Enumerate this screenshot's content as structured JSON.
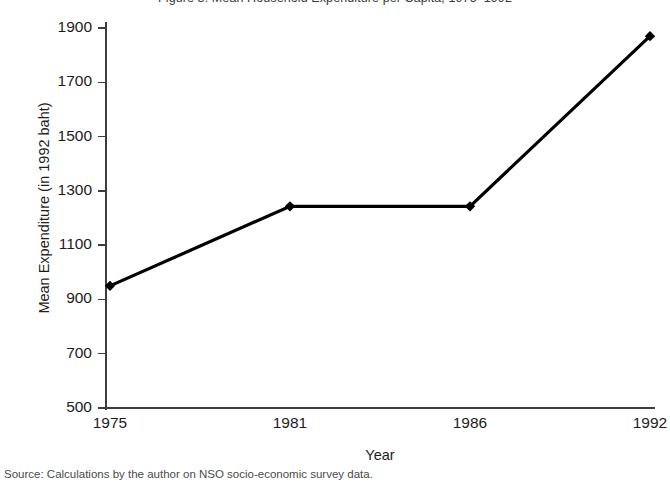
{
  "figure": {
    "clipped_title_top": "Figure 3.  Mean Household Expenditure per Capita, 1975–1992",
    "clipped_caption_bottom": "Source:  Calculations by the author on NSO socio-economic survey data."
  },
  "chart_data": {
    "type": "line",
    "title": "",
    "xlabel": "Year",
    "ylabel": "Mean Expenditure (in 1992 baht)",
    "categories": [
      "1975",
      "1981",
      "1986",
      "1992"
    ],
    "x": [
      1975,
      1981,
      1986,
      1992
    ],
    "values": [
      950,
      1243,
      1243,
      1870
    ],
    "series": [
      {
        "name": "Mean Expenditure",
        "values": [
          950,
          1243,
          1243,
          1870
        ]
      }
    ],
    "ylim": [
      500,
      1900
    ],
    "yticks": [
      500,
      700,
      900,
      1100,
      1300,
      1500,
      1700,
      1900
    ],
    "ytick_labels": [
      "500",
      "700",
      "900",
      "1100",
      "1300",
      "1500",
      "1700",
      "1900"
    ],
    "xtick_labels": [
      "1975",
      "1981",
      "1986",
      "1992"
    ],
    "grid": false,
    "legend": false,
    "marker": "diamond",
    "line_color": "#000000",
    "marker_color": "#000000",
    "axis_color": "#3d3d3d",
    "background_color": "#ffffff"
  }
}
